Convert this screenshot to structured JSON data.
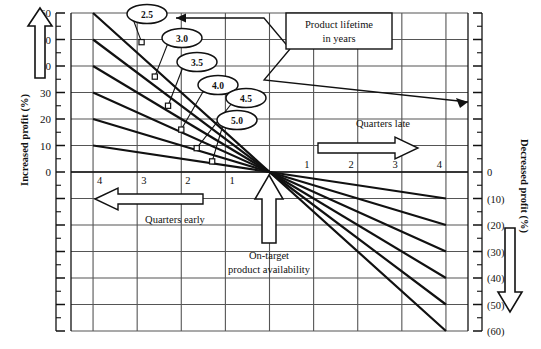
{
  "chart_data": {
    "type": "line",
    "title": "",
    "subtitle": "",
    "xlabel_left": "Quarters early",
    "xlabel_right": "Quarters late",
    "ylabel_left": "Increased profit (%)",
    "ylabel_right": "Decreased profit (%)",
    "legend_title": "Product lifetime in years",
    "legend_position": "top-right-callout-box",
    "grid": true,
    "x": [
      -4,
      -3,
      -2,
      -1,
      0,
      1,
      2,
      3,
      4
    ],
    "xtick_labels_left": [
      "4",
      "3",
      "2",
      "1"
    ],
    "xtick_labels_right": [
      "1",
      "2",
      "3",
      "4"
    ],
    "xlim": [
      -4.5,
      4.5
    ],
    "ylim": [
      -60,
      60
    ],
    "ytick_labels_left": [
      "60",
      "50",
      "40",
      "30",
      "20",
      "10",
      "0"
    ],
    "ytick_values_left": [
      60,
      50,
      40,
      30,
      20,
      10,
      0
    ],
    "ytick_labels_right": [
      "0",
      "(10)",
      "(20)",
      "(30)",
      "(40)",
      "(50)",
      "(60)"
    ],
    "ytick_values_right": [
      0,
      -10,
      -20,
      -30,
      -40,
      -50,
      -60
    ],
    "origin_label": "On-target product availability",
    "series": [
      {
        "name": "2.5",
        "lifetime_years": 2.5,
        "x": [
          -4,
          0,
          4
        ],
        "values": [
          60,
          0,
          -60
        ],
        "marker_x": -2.9,
        "marker_y": 49
      },
      {
        "name": "3.0",
        "lifetime_years": 3.0,
        "x": [
          -4,
          0,
          4
        ],
        "values": [
          50,
          0,
          -50
        ],
        "marker_x": -2.6,
        "marker_y": 36
      },
      {
        "name": "3.5",
        "lifetime_years": 3.5,
        "x": [
          -4,
          0,
          4
        ],
        "values": [
          40,
          0,
          -40
        ],
        "marker_x": -2.3,
        "marker_y": 25
      },
      {
        "name": "4.0",
        "lifetime_years": 4.0,
        "x": [
          -4,
          0,
          4
        ],
        "values": [
          30,
          0,
          -30
        ],
        "marker_x": -2.0,
        "marker_y": 16
      },
      {
        "name": "4.5",
        "lifetime_years": 4.5,
        "x": [
          -4,
          0,
          4
        ],
        "values": [
          20,
          0,
          -20
        ],
        "marker_x": -1.65,
        "marker_y": 9
      },
      {
        "name": "5.0",
        "lifetime_years": 5.0,
        "x": [
          -4,
          0,
          4
        ],
        "values": [
          10,
          0,
          -10
        ],
        "marker_x": -1.3,
        "marker_y": 4
      }
    ],
    "callout_labels": [
      "2.5",
      "3.0",
      "3.5",
      "4.0",
      "4.5",
      "5.0"
    ],
    "annotations": [
      {
        "text": "Product lifetime in years",
        "kind": "legend-box"
      },
      {
        "text": "Quarters late",
        "kind": "direction-right"
      },
      {
        "text": "Quarters early",
        "kind": "direction-left"
      },
      {
        "text": "On-target product availability",
        "kind": "origin-marker"
      }
    ]
  },
  "legend_box": {
    "line1": "Product lifetime",
    "line2": "in years"
  },
  "origin": {
    "line1": "On-target",
    "line2": "product availability"
  },
  "direction": {
    "early": "Quarters early",
    "late": "Quarters late"
  },
  "axes": {
    "left_title": "Increased profit (%)",
    "right_title": "Decreased profit (%)"
  },
  "colors": {
    "ink": "#111111",
    "grid": "#555555",
    "paper": "#ffffff"
  }
}
